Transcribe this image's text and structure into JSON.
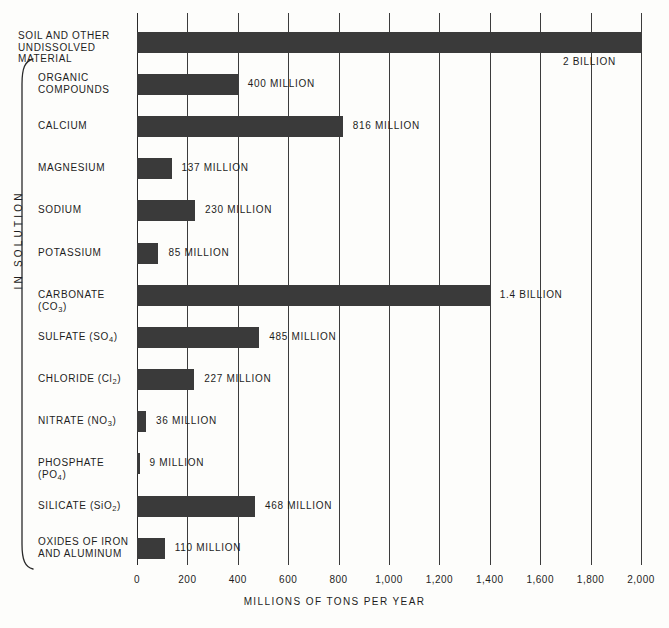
{
  "chart_data": {
    "type": "bar",
    "orientation": "horizontal",
    "title": "",
    "xlabel": "MILLIONS OF TONS PER YEAR",
    "ylabel": "",
    "xlim": [
      0,
      2000
    ],
    "grid": true,
    "legend": null,
    "xticks": [
      "0",
      "200",
      "400",
      "600",
      "800",
      "1,000",
      "1,200",
      "1,400",
      "1,600",
      "1,800",
      "2,000"
    ],
    "xtick_values": [
      0,
      200,
      400,
      600,
      800,
      1000,
      1200,
      1400,
      1600,
      1800,
      2000
    ],
    "categories": [
      "SOIL AND OTHER\nUNDISSOLVED MATERIAL",
      "ORGANIC\nCOMPOUNDS",
      "CALCIUM",
      "MAGNESIUM",
      "SODIUM",
      "POTASSIUM",
      "CARBONATE (CO3)",
      "SULFATE (SO4)",
      "CHLORIDE (Cl2)",
      "NITRATE (NO3)",
      "PHOSPHATE (PO4)",
      "SILICATE (SiO2)",
      "OXIDES OF IRON\nAND ALUMINUM"
    ],
    "values": [
      2000,
      400,
      816,
      137,
      230,
      85,
      1400,
      485,
      227,
      36,
      9,
      468,
      110
    ],
    "data_labels": [
      "2 BILLION",
      "400 MILLION",
      "816 MILLION",
      "137 MILLION",
      "230 MILLION",
      "85 MILLION",
      "1.4 BILLION",
      "485 MILLION",
      "227 MILLION",
      "36 MILLION",
      "9 MILLION",
      "468 MILLION",
      "110 MILLION"
    ],
    "group_bracket_label": "IN SOLUTION",
    "group_bracket_members": [
      "ORGANIC COMPOUNDS",
      "CALCIUM",
      "MAGNESIUM",
      "SODIUM",
      "POTASSIUM",
      "CARBONATE (CO3)",
      "SULFATE (SO4)",
      "CHLORIDE (Cl2)",
      "NITRATE (NO3)",
      "PHOSPHATE (PO4)",
      "SILICATE (SiO2)",
      "OXIDES OF IRON AND ALUMINUM"
    ],
    "colors": {
      "bar": "#3a3a3a",
      "grid": "#3c3c3c",
      "text": "#1d1d1d",
      "background": "#fdfdfb"
    }
  },
  "rows": [
    {
      "label_line1": "SOIL AND OTHER",
      "label_line2": "UNDISSOLVED MATERIAL",
      "value_label": "2 BILLION",
      "value": 2000
    },
    {
      "label_line1": "ORGANIC",
      "label_line2": "COMPOUNDS",
      "value_label": "400 MILLION",
      "value": 400
    },
    {
      "label_line1": "CALCIUM",
      "label_line2": "",
      "value_label": "816 MILLION",
      "value": 816
    },
    {
      "label_line1": "MAGNESIUM",
      "label_line2": "",
      "value_label": "137 MILLION",
      "value": 137
    },
    {
      "label_line1": "SODIUM",
      "label_line2": "",
      "value_label": "230 MILLION",
      "value": 230
    },
    {
      "label_line1": "POTASSIUM",
      "label_line2": "",
      "value_label": "85 MILLION",
      "value": 85
    },
    {
      "label_line1": "CARBONATE (CO3)",
      "label_line2": "",
      "value_label": "1.4 BILLION",
      "value": 1400
    },
    {
      "label_line1": "SULFATE (SO4)",
      "label_line2": "",
      "value_label": "485 MILLION",
      "value": 485
    },
    {
      "label_line1": "CHLORIDE (Cl2)",
      "label_line2": "",
      "value_label": "227 MILLION",
      "value": 227
    },
    {
      "label_line1": "NITRATE (NO3)",
      "label_line2": "",
      "value_label": "36 MILLION",
      "value": 36
    },
    {
      "label_line1": "PHOSPHATE (PO4)",
      "label_line2": "",
      "value_label": "9 MILLION",
      "value": 9
    },
    {
      "label_line1": "SILICATE (SiO2)",
      "label_line2": "",
      "value_label": "468 MILLION",
      "value": 468
    },
    {
      "label_line1": "OXIDES OF IRON",
      "label_line2": "AND ALUMINUM",
      "value_label": "110 MILLION",
      "value": 110
    }
  ],
  "axis": {
    "title": "MILLIONS OF TONS PER YEAR"
  },
  "bracket": {
    "label": "IN SOLUTION"
  }
}
